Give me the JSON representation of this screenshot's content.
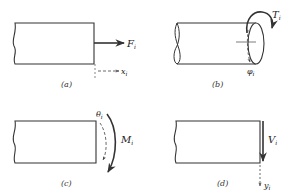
{
  "figure": {
    "panels": [
      {
        "id": "a",
        "caption": "(a)",
        "force_label": "F",
        "force_sub": "i",
        "disp_label": "x",
        "disp_sub": "i",
        "description": "Axial force on bar end"
      },
      {
        "id": "b",
        "caption": "(b)",
        "force_label": "T",
        "force_sub": "i",
        "disp_label": "φ",
        "disp_sub": "i",
        "description": "Torque on shaft end"
      },
      {
        "id": "c",
        "caption": "(c)",
        "force_label": "M",
        "force_sub": "i",
        "disp_label": "θ",
        "disp_sub": "i",
        "description": "Bending moment on beam end"
      },
      {
        "id": "d",
        "caption": "(d)",
        "force_label": "V",
        "force_sub": "i",
        "disp_label": "y",
        "disp_sub": "i",
        "description": "Shear force on beam end"
      }
    ],
    "colors": {
      "stroke": "#333333",
      "background": "#ffffff"
    }
  }
}
